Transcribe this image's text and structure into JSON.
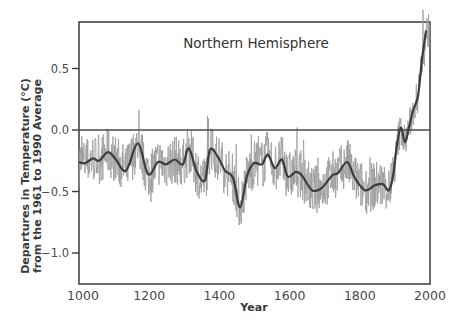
{
  "chart_data": {
    "type": "line",
    "title": "Northern Hemisphere",
    "xlabel": "Year",
    "ylabel": "Departures in Temperature (°C) from the 1961 to 1990 Average",
    "ylabel_lines": [
      "Departures in Temperature (°C)",
      "from the 1961 to 1990 Average"
    ],
    "xlim": [
      1000,
      2000
    ],
    "ylim": [
      -1.25,
      0.87
    ],
    "x_ticks": [
      1000,
      1200,
      1400,
      1600,
      1800,
      2000
    ],
    "x_tick_labels": [
      "1000",
      "1200",
      "1400",
      "1600",
      "1800",
      "2000"
    ],
    "y_ticks": [
      0.5,
      0.0,
      -0.5,
      -1.0
    ],
    "y_tick_labels": [
      "0.5",
      "0.0",
      "−0.5",
      "−1.0"
    ],
    "reference_line": 0.0,
    "grid": false,
    "legend": null,
    "series": [
      {
        "name": "Smoothed (≈40-year filter)",
        "style": "thick dark line",
        "x": [
          1000,
          1017,
          1040,
          1057,
          1083,
          1105,
          1134,
          1168,
          1197,
          1225,
          1248,
          1273,
          1296,
          1313,
          1336,
          1359,
          1373,
          1396,
          1416,
          1439,
          1459,
          1479,
          1499,
          1521,
          1538,
          1558,
          1578,
          1595,
          1618,
          1635,
          1664,
          1692,
          1721,
          1738,
          1764,
          1786,
          1815,
          1843,
          1866,
          1883,
          1895,
          1906,
          1917,
          1929,
          1940,
          1952,
          1966,
          1977,
          1989
        ],
        "values": [
          -0.26,
          -0.27,
          -0.23,
          -0.25,
          -0.18,
          -0.24,
          -0.33,
          -0.11,
          -0.36,
          -0.26,
          -0.28,
          -0.24,
          -0.28,
          -0.15,
          -0.34,
          -0.41,
          -0.16,
          -0.22,
          -0.33,
          -0.39,
          -0.63,
          -0.37,
          -0.27,
          -0.28,
          -0.2,
          -0.31,
          -0.24,
          -0.38,
          -0.34,
          -0.37,
          -0.49,
          -0.47,
          -0.37,
          -0.35,
          -0.26,
          -0.39,
          -0.49,
          -0.45,
          -0.44,
          -0.49,
          -0.37,
          -0.12,
          0.02,
          -0.1,
          0.02,
          0.16,
          0.28,
          0.57,
          0.81
        ]
      },
      {
        "name": "Annual reconstruction / instrumental",
        "style": "thin gray noisy line",
        "approx_range": [
          -0.75,
          0.85
        ],
        "description": "High-frequency annual values fluctuating roughly ±0.2 °C around the smoothed curve; instrumental record after ~1900 rising to ~0.8 °C by late 1990s"
      }
    ]
  },
  "colors": {
    "smoothed_line": "#3c3c3c",
    "raw_line": "#9a9a9a",
    "axis": "#3a3a3a",
    "background": "#ffffff"
  }
}
